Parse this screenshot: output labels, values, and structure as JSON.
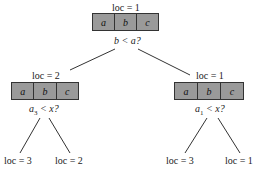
{
  "root": {
    "loc": "loc = 1",
    "cells": [
      "a",
      "b",
      "c"
    ],
    "question": "b < a?"
  },
  "left": {
    "loc": "loc = 2",
    "cells": [
      "a",
      "b",
      "c"
    ],
    "question_var": "a",
    "question_sub": "3",
    "question_rest": " < x?",
    "children": [
      {
        "loc": "loc = 3"
      },
      {
        "loc": "loc = 2"
      }
    ]
  },
  "right": {
    "loc": "loc = 1",
    "cells": [
      "a",
      "b",
      "c"
    ],
    "question_var": "a",
    "question_sub": "1",
    "question_rest": " < x?",
    "children": [
      {
        "loc": "loc = 3"
      },
      {
        "loc": "loc = 1"
      }
    ]
  },
  "colors": {
    "cell_fill": "#9a9a9a",
    "line": "#333333"
  }
}
